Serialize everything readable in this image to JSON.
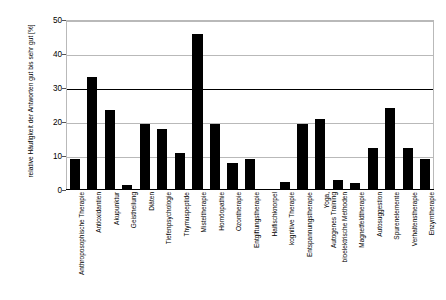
{
  "chart_data": {
    "type": "bar",
    "title": "",
    "xlabel": "",
    "ylabel": "relative Häufigkeit der Antworten gut bis sehr gut [%]",
    "ylim": [
      0,
      50
    ],
    "yticks": [
      0,
      10,
      20,
      30,
      40,
      50
    ],
    "grid": true,
    "legend": "none",
    "bar_color": "#000000",
    "categories": [
      "Anthroposophische Therapie",
      "Antioxidantien",
      "Akupunktur",
      "Geistheilung",
      "Diäten",
      "Tiefenpsychologie",
      "Thymuspeptide",
      "Misteltherapie",
      "Homöopathie",
      "Ozontherapie",
      "Entgiftungstherapie",
      "Haifischknorpel",
      "kognitive Therapie",
      "Entspannungstherapie",
      "Yoga,\nAutogenes Training",
      "bioelektrische Methoden",
      "Magnetfeldtherapie",
      "Autosuggestion",
      "Spurenelemente",
      "Verhaltenstherapie",
      "Enzymtherapie"
    ],
    "values": [
      9,
      33.3,
      23.5,
      1.5,
      19.5,
      18,
      11,
      46,
      19.3,
      8,
      9,
      0,
      2.5,
      19.3,
      21,
      3,
      2,
      12.5,
      24,
      12.5,
      9
    ]
  },
  "axis": {
    "y_tick_labels": [
      "0",
      "10",
      "20",
      "30",
      "40",
      "50"
    ]
  }
}
